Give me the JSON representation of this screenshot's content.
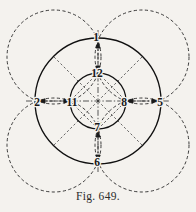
{
  "figure": {
    "caption": "Fig. 649.",
    "background_color": "#f4f2ee",
    "ink_color": "#1a1a1a",
    "center": {
      "x": 98,
      "y": 101
    },
    "solid_circles": [
      {
        "name": "outer-circle",
        "cx": 98,
        "cy": 101,
        "r": 63,
        "style": "solid"
      },
      {
        "name": "inner-circle",
        "cx": 98,
        "cy": 101,
        "r": 28,
        "style": "solid"
      }
    ],
    "dashed_circles": [
      {
        "name": "dashed-circle-top-left",
        "cx": 54,
        "cy": 57,
        "r": 47,
        "style": "dashed"
      },
      {
        "name": "dashed-circle-top-right",
        "cx": 142,
        "cy": 57,
        "r": 47,
        "style": "dashed"
      },
      {
        "name": "dashed-circle-bottom-left",
        "cx": 54,
        "cy": 145,
        "r": 47,
        "style": "dashed"
      },
      {
        "name": "dashed-circle-bottom-right",
        "cx": 142,
        "cy": 145,
        "r": 47,
        "style": "dashed"
      }
    ],
    "labels": [
      {
        "id": "label-1",
        "text": "1",
        "x": 96,
        "y": 41,
        "position": "outer-top"
      },
      {
        "id": "label-12",
        "text": "12",
        "x": 96,
        "y": 76,
        "position": "inner-top"
      },
      {
        "id": "label-2",
        "text": "2",
        "x": 37,
        "y": 105,
        "position": "outer-left"
      },
      {
        "id": "label-11",
        "text": "11",
        "x": 72,
        "y": 105,
        "position": "inner-left"
      },
      {
        "id": "label-8",
        "text": "8",
        "x": 124,
        "y": 105,
        "position": "inner-right"
      },
      {
        "id": "label-5",
        "text": "5",
        "x": 160,
        "y": 105,
        "position": "outer-right"
      },
      {
        "id": "label-7",
        "text": "7",
        "x": 96,
        "y": 130,
        "position": "inner-bottom"
      },
      {
        "id": "label-6",
        "text": "6",
        "x": 96,
        "y": 165,
        "position": "outer-bottom"
      }
    ],
    "axes": [
      {
        "name": "horizontal-axis",
        "x1": 26,
        "y1": 101,
        "x2": 170,
        "y2": 101,
        "style": "dash-dot"
      },
      {
        "name": "vertical-axis",
        "x1": 98,
        "y1": 30,
        "x2": 98,
        "y2": 172,
        "style": "dash-dot"
      }
    ],
    "arrows": [
      {
        "name": "arrow-2-to-11",
        "from": "2",
        "to": "11",
        "orientation": "horizontal"
      },
      {
        "name": "arrow-8-to-5",
        "from": "8",
        "to": "5",
        "orientation": "horizontal"
      },
      {
        "name": "arrow-1-to-12",
        "from": "1",
        "to": "12",
        "orientation": "vertical"
      },
      {
        "name": "arrow-7-to-6",
        "from": "7",
        "to": "6",
        "orientation": "vertical"
      }
    ],
    "diagonals": [
      {
        "name": "diagonal-top-left",
        "from_label": "12",
        "to_label": "11"
      },
      {
        "name": "diagonal-top-right",
        "from_label": "12",
        "to_label": "8"
      },
      {
        "name": "diagonal-bottom-left",
        "from_label": "7",
        "to_label": "11"
      },
      {
        "name": "diagonal-bottom-right",
        "from_label": "7",
        "to_label": "8"
      }
    ],
    "radial_spokes": [
      {
        "name": "spoke-upper-left",
        "angle_deg": 225
      },
      {
        "name": "spoke-upper-right",
        "angle_deg": 315
      },
      {
        "name": "spoke-lower-left",
        "angle_deg": 135
      },
      {
        "name": "spoke-lower-right",
        "angle_deg": 45
      }
    ]
  }
}
